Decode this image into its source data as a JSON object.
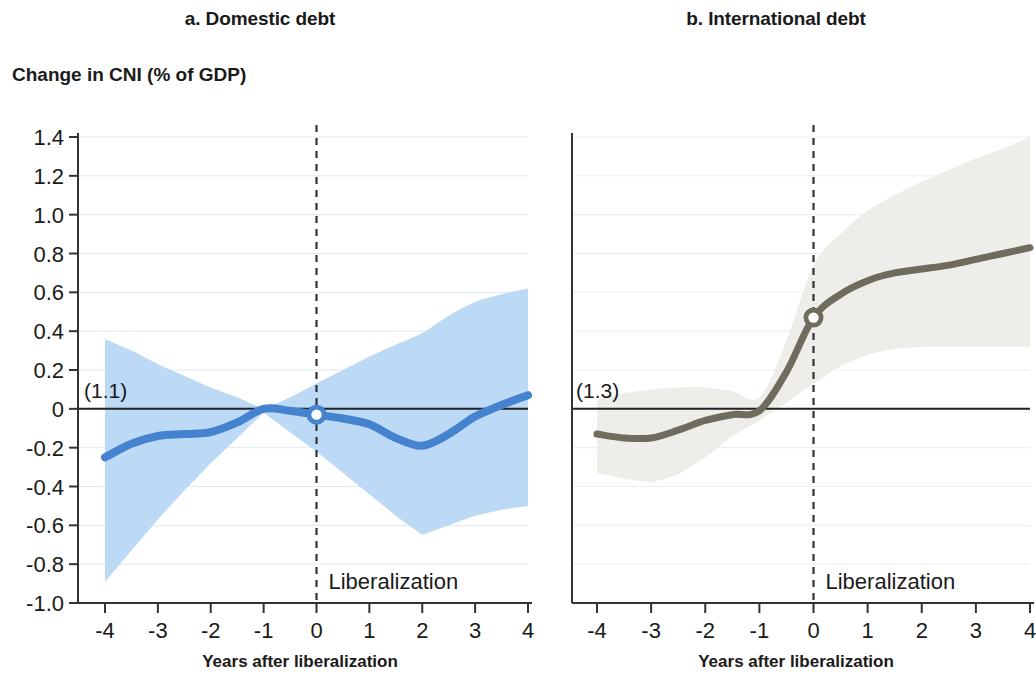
{
  "figure": {
    "ylabel": "Change in CNI (% of GDP)",
    "panels": [
      {
        "id": "a",
        "title": "a. Domestic debt",
        "xlabel": "Years after liberalization",
        "annotation": "(1.1)",
        "event_label": "Liberalization",
        "line_color": "#4583cf",
        "band_color": "#bcd9f5",
        "marker_label": "0"
      },
      {
        "id": "b",
        "title": "b. International debt",
        "xlabel": "Years after liberalization",
        "annotation": "(1.3)",
        "event_label": "Liberalization",
        "line_color": "#6f6c5e",
        "band_color": "#eeedea",
        "marker_label": "0"
      }
    ]
  },
  "chart_data": [
    {
      "type": "line",
      "title": "a. Domestic debt",
      "xlabel": "Years after liberalization",
      "ylabel": "Change in CNI (% of GDP)",
      "annotation": "(1.1)",
      "event_marker": {
        "x": 0,
        "y": -0.03,
        "label": "Liberalization"
      },
      "xlim": [
        -4,
        4
      ],
      "ylim": [
        -1.0,
        1.4
      ],
      "xticks": [
        -4,
        -3,
        -2,
        -1,
        0,
        1,
        2,
        3,
        4
      ],
      "xticklabels": [
        "-4",
        "-3",
        "-2",
        "-1",
        "0",
        "1",
        "2",
        "3",
        "4"
      ],
      "yticks": [
        -1.0,
        -0.8,
        -0.6,
        -0.4,
        -0.2,
        0,
        0.2,
        0.4,
        0.6,
        0.8,
        1.0,
        1.2,
        1.4
      ],
      "yticklabels": [
        "-1.0",
        "-0.8",
        "-0.6",
        "-0.4",
        "-0.2",
        "0",
        "0.2",
        "0.4",
        "0.6",
        "0.8",
        "1.0",
        "1.2",
        "1.4"
      ],
      "grid": true,
      "legend": "none",
      "x": [
        -4,
        -3.5,
        -3,
        -2.5,
        -2,
        -1.5,
        -1,
        -0.5,
        0,
        0.5,
        1,
        1.5,
        2,
        2.5,
        3,
        3.5,
        4
      ],
      "series": [
        {
          "name": "Domestic debt point estimate",
          "color": "#4583cf",
          "values": [
            -0.25,
            -0.18,
            -0.14,
            -0.13,
            -0.12,
            -0.07,
            0.0,
            -0.01,
            -0.03,
            -0.05,
            -0.08,
            -0.15,
            -0.19,
            -0.13,
            -0.04,
            0.02,
            0.07
          ]
        },
        {
          "name": "Confidence band upper",
          "color": "#bcd9f5",
          "values": [
            0.36,
            0.3,
            0.23,
            0.17,
            0.11,
            0.06,
            0.01,
            0.06,
            0.13,
            0.2,
            0.27,
            0.33,
            0.39,
            0.48,
            0.55,
            0.59,
            0.62
          ]
        },
        {
          "name": "Confidence band lower",
          "color": "#bcd9f5",
          "values": [
            -0.89,
            -0.73,
            -0.57,
            -0.42,
            -0.28,
            -0.15,
            -0.02,
            -0.12,
            -0.22,
            -0.33,
            -0.44,
            -0.55,
            -0.65,
            -0.6,
            -0.55,
            -0.52,
            -0.5
          ]
        }
      ]
    },
    {
      "type": "line",
      "title": "b. International debt",
      "xlabel": "Years after liberalization",
      "ylabel": "Change in CNI (% of GDP)",
      "annotation": "(1.3)",
      "event_marker": {
        "x": 0,
        "y": 0.47,
        "label": "Liberalization"
      },
      "xlim": [
        -4,
        4
      ],
      "ylim": [
        -1.0,
        1.4
      ],
      "xticks": [
        -4,
        -3,
        -2,
        -1,
        0,
        1,
        2,
        3,
        4
      ],
      "xticklabels": [
        "-4",
        "-3",
        "-2",
        "-1",
        "0",
        "1",
        "2",
        "3",
        "4"
      ],
      "yticks": [
        -1.0,
        -0.8,
        -0.6,
        -0.4,
        -0.2,
        0,
        0.2,
        0.4,
        0.6,
        0.8,
        1.0,
        1.2,
        1.4
      ],
      "grid": true,
      "legend": "none",
      "x": [
        -4,
        -3.5,
        -3,
        -2.5,
        -2,
        -1.5,
        -1,
        -0.5,
        0,
        0.5,
        1,
        1.5,
        2,
        2.5,
        3,
        3.5,
        4
      ],
      "series": [
        {
          "name": "International debt point estimate",
          "color": "#6f6c5e",
          "values": [
            -0.13,
            -0.15,
            -0.15,
            -0.11,
            -0.06,
            -0.03,
            -0.01,
            0.19,
            0.47,
            0.59,
            0.66,
            0.7,
            0.72,
            0.74,
            0.77,
            0.8,
            0.83
          ]
        },
        {
          "name": "Confidence band upper",
          "color": "#eeedea",
          "values": [
            0.05,
            0.08,
            0.1,
            0.11,
            0.11,
            0.09,
            0.06,
            0.35,
            0.74,
            0.9,
            1.02,
            1.1,
            1.17,
            1.23,
            1.29,
            1.34,
            1.4
          ]
        },
        {
          "name": "Confidence band lower",
          "color": "#eeedea",
          "values": [
            -0.33,
            -0.36,
            -0.38,
            -0.34,
            -0.25,
            -0.14,
            -0.06,
            0.03,
            0.13,
            0.22,
            0.28,
            0.31,
            0.32,
            0.32,
            0.32,
            0.32,
            0.32
          ]
        }
      ]
    }
  ]
}
